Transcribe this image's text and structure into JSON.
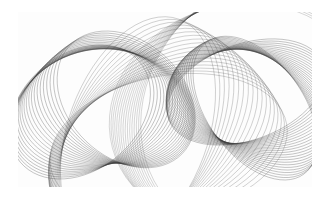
{
  "artwork": {
    "background": "#ffffff",
    "frame": {
      "x": 18,
      "y": 12,
      "width": 294,
      "height": 175
    },
    "stroke_color": "#3a3a3a",
    "clusters": [
      {
        "name": "left-ellipse-cluster",
        "cx": 62,
        "cy": 100,
        "rx": 78,
        "ry": 58,
        "count": 22,
        "rotation_start": -40,
        "rotation_step": 4,
        "shift_x": 2.2,
        "shift_y": -0.6,
        "opacity": 0.45
      },
      {
        "name": "center-ellipse-cluster",
        "cx": 120,
        "cy": 120,
        "rx": 70,
        "ry": 120,
        "count": 18,
        "rotation_start": 20,
        "rotation_step": 3.5,
        "shift_x": 1.8,
        "shift_y": 0.8,
        "opacity": 0.35
      },
      {
        "name": "right-lens-cluster",
        "cx": 228,
        "cy": 80,
        "rx": 82,
        "ry": 48,
        "count": 24,
        "rotation_start": -20,
        "rotation_step": 3.2,
        "shift_x": 0.4,
        "shift_y": 0.7,
        "opacity": 0.45
      },
      {
        "name": "right-outer-cluster",
        "cx": 238,
        "cy": 95,
        "rx": 110,
        "ry": 130,
        "count": 16,
        "rotation_start": 30,
        "rotation_step": 3,
        "shift_x": -1.2,
        "shift_y": 0.5,
        "opacity": 0.3
      }
    ]
  }
}
